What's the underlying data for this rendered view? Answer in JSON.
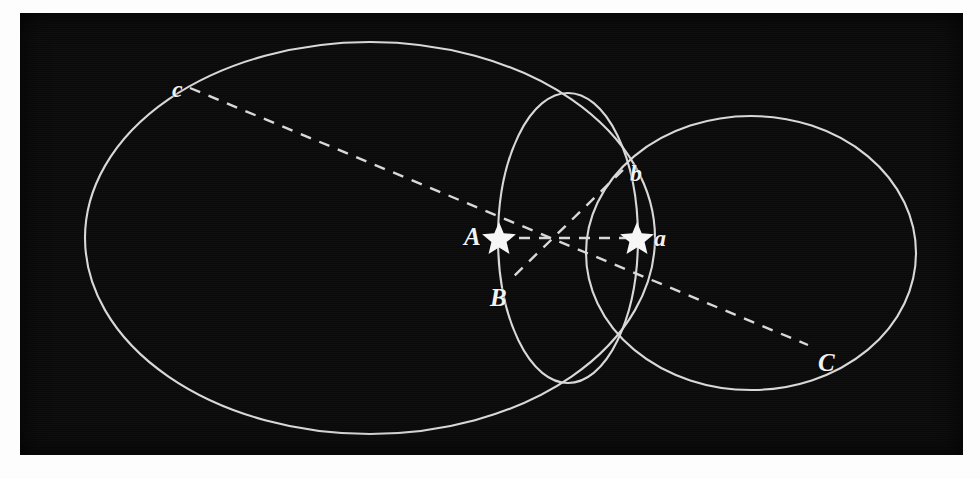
{
  "figure": {
    "kind": "geometric-diagram",
    "background_color": "#0b0b0b",
    "stroke_color": "#d8d8d8",
    "label_color": "#f2f2f2",
    "page_color": "#fdfdfd",
    "plate": {
      "x": 20,
      "y": 13,
      "width": 943,
      "height": 442
    }
  },
  "labels": {
    "c": "c",
    "b": "b",
    "A": "A",
    "a": "a",
    "B": "B",
    "C": "C"
  },
  "label_positions": {
    "c": {
      "x": 152,
      "y": 64
    },
    "b": {
      "x": 610,
      "y": 148
    },
    "A": {
      "x": 444,
      "y": 223
    },
    "a": {
      "x": 634,
      "y": 223
    },
    "B": {
      "x": 470,
      "y": 272
    },
    "C": {
      "x": 798,
      "y": 337
    }
  },
  "shapes": {
    "big_ellipse": {
      "name": "large-ellipse",
      "cx": 350,
      "cy": 225,
      "rx": 285,
      "ry": 196,
      "rotation": 0
    },
    "right_ellipse": {
      "name": "right-ellipse",
      "cx": 731,
      "cy": 240,
      "rx": 165,
      "ry": 137,
      "rotation": 0
    },
    "small_circle": {
      "name": "small-circle",
      "cx": 548,
      "cy": 225,
      "rx": 70,
      "ry": 145,
      "rotation": 0
    }
  },
  "points": {
    "star_A": {
      "x": 479,
      "y": 225,
      "label": "A"
    },
    "star_a": {
      "x": 617,
      "y": 225,
      "label": "a"
    },
    "crossing": {
      "x": 529,
      "y": 225
    },
    "c_end": {
      "x": 170,
      "y": 75,
      "label": "c"
    },
    "C_end": {
      "x": 788,
      "y": 332,
      "label": "C"
    },
    "b_end": {
      "x": 603,
      "y": 157,
      "label": "b"
    },
    "B_end": {
      "x": 492,
      "y": 265,
      "label": "B"
    }
  },
  "lines": [
    {
      "name": "dashed-line-c-C",
      "from": "c_end",
      "to": "C_end",
      "style": "dashed"
    },
    {
      "name": "dashed-line-b-B",
      "from": "b_end",
      "to": "B_end",
      "style": "dashed"
    },
    {
      "name": "dashed-line-A-a",
      "from": "star_A",
      "to": "star_a",
      "style": "dashed"
    }
  ]
}
